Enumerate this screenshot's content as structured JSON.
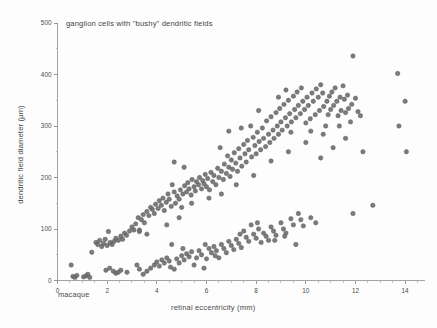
{
  "figure": {
    "width": 437,
    "height": 328,
    "background": "#fdfdfd",
    "corner_note": "macaque"
  },
  "chart_data": {
    "type": "scatter",
    "title": "ganglion cells with \"bushy\" dendritic fields",
    "xlabel": "retinal eccentricity (mm)",
    "ylabel": "dendritic field diameter (µm)",
    "xlim": [
      0,
      14.8
    ],
    "ylim": [
      0,
      500
    ],
    "xticks": [
      0,
      2,
      4,
      6,
      8,
      10,
      12,
      14
    ],
    "yticks": [
      0,
      100,
      200,
      300,
      400,
      500
    ],
    "xticklabels": [
      "0",
      "2",
      "4",
      "6",
      "8",
      "10",
      "12",
      "14"
    ],
    "yticklabels": [
      "0",
      "100",
      "200",
      "300",
      "400",
      "500"
    ],
    "x_minor_step": 0.5,
    "y_minor_step": 50,
    "grid": false,
    "legend": null,
    "annotations": [
      "macaque"
    ],
    "marker": {
      "shape": "circle",
      "color": "#6e6e6e",
      "edge_color": "#5a5a5a",
      "size_px": 4.4,
      "opacity": 0.9
    },
    "series": [
      {
        "name": "upper band (outer/parasol-like bushy cells)",
        "color": "#6e6e6e",
        "points": [
          [
            0.55,
            30
          ],
          [
            0.62,
            8
          ],
          [
            0.7,
            6
          ],
          [
            0.78,
            10
          ],
          [
            1.05,
            7
          ],
          [
            1.15,
            9
          ],
          [
            1.22,
            12
          ],
          [
            1.3,
            6
          ],
          [
            1.38,
            55
          ],
          [
            1.55,
            74
          ],
          [
            1.62,
            70
          ],
          [
            1.7,
            78
          ],
          [
            1.78,
            66
          ],
          [
            1.85,
            72
          ],
          [
            1.92,
            80
          ],
          [
            2.0,
            68
          ],
          [
            2.05,
            95
          ],
          [
            2.12,
            74
          ],
          [
            2.2,
            70
          ],
          [
            2.28,
            76
          ],
          [
            2.35,
            82
          ],
          [
            2.45,
            78
          ],
          [
            2.55,
            86
          ],
          [
            2.62,
            80
          ],
          [
            2.7,
            92
          ],
          [
            2.78,
            88
          ],
          [
            2.9,
            96
          ],
          [
            3.0,
            104
          ],
          [
            3.08,
            98
          ],
          [
            3.15,
            110
          ],
          [
            3.25,
            122
          ],
          [
            3.3,
            95
          ],
          [
            3.38,
            118
          ],
          [
            3.45,
            128
          ],
          [
            3.5,
            112
          ],
          [
            3.6,
            134
          ],
          [
            3.68,
            126
          ],
          [
            3.75,
            142
          ],
          [
            3.82,
            138
          ],
          [
            3.9,
            130
          ],
          [
            3.95,
            148
          ],
          [
            4.05,
            140
          ],
          [
            4.1,
            155
          ],
          [
            4.18,
            146
          ],
          [
            4.25,
            160
          ],
          [
            4.3,
            136
          ],
          [
            4.38,
            152
          ],
          [
            4.45,
            168
          ],
          [
            4.5,
            158
          ],
          [
            4.58,
            144
          ],
          [
            4.62,
            186
          ],
          [
            4.7,
            172
          ],
          [
            4.75,
            150
          ],
          [
            4.82,
            164
          ],
          [
            4.9,
            158
          ],
          [
            4.95,
            176
          ],
          [
            5.0,
            142
          ],
          [
            5.05,
            168
          ],
          [
            5.12,
            184
          ],
          [
            5.2,
            172
          ],
          [
            5.25,
            190
          ],
          [
            5.3,
            178
          ],
          [
            5.38,
            166
          ],
          [
            5.42,
            196
          ],
          [
            5.5,
            182
          ],
          [
            5.55,
            174
          ],
          [
            5.6,
            192
          ],
          [
            5.68,
            186
          ],
          [
            5.72,
            200
          ],
          [
            5.8,
            178
          ],
          [
            5.85,
            194
          ],
          [
            5.9,
            188
          ],
          [
            5.95,
            206
          ],
          [
            6.0,
            182
          ],
          [
            6.05,
            198
          ],
          [
            6.12,
            176
          ],
          [
            6.18,
            210
          ],
          [
            6.25,
            192
          ],
          [
            6.3,
            204
          ],
          [
            6.38,
            186
          ],
          [
            6.45,
            218
          ],
          [
            6.5,
            200
          ],
          [
            6.55,
            258
          ],
          [
            6.6,
            212
          ],
          [
            6.68,
            196
          ],
          [
            6.72,
            226
          ],
          [
            6.8,
            208
          ],
          [
            6.85,
            242
          ],
          [
            6.9,
            220
          ],
          [
            6.95,
            202
          ],
          [
            7.0,
            234
          ],
          [
            7.05,
            216
          ],
          [
            7.12,
            248
          ],
          [
            7.18,
            228
          ],
          [
            7.25,
            212
          ],
          [
            7.3,
            256
          ],
          [
            7.35,
            238
          ],
          [
            7.42,
            222
          ],
          [
            7.5,
            264
          ],
          [
            7.55,
            246
          ],
          [
            7.6,
            230
          ],
          [
            7.65,
            272
          ],
          [
            7.7,
            254
          ],
          [
            7.78,
            300
          ],
          [
            7.82,
            240
          ],
          [
            7.88,
            278
          ],
          [
            7.95,
            262
          ],
          [
            8.0,
            246
          ],
          [
            8.05,
            288
          ],
          [
            8.12,
            270
          ],
          [
            8.18,
            254
          ],
          [
            8.25,
            296
          ],
          [
            8.3,
            276
          ],
          [
            8.38,
            260
          ],
          [
            8.42,
            310
          ],
          [
            8.5,
            284
          ],
          [
            8.55,
            268
          ],
          [
            8.6,
            318
          ],
          [
            8.68,
            292
          ],
          [
            8.72,
            276
          ],
          [
            8.8,
            326
          ],
          [
            8.85,
            300
          ],
          [
            8.9,
            284
          ],
          [
            8.95,
            334
          ],
          [
            9.0,
            308
          ],
          [
            9.05,
            292
          ],
          [
            9.12,
            342
          ],
          [
            9.18,
            316
          ],
          [
            9.2,
            370
          ],
          [
            9.25,
            300
          ],
          [
            9.3,
            350
          ],
          [
            9.35,
            324
          ],
          [
            9.42,
            308
          ],
          [
            9.5,
            358
          ],
          [
            9.55,
            332
          ],
          [
            9.6,
            316
          ],
          [
            9.65,
            366
          ],
          [
            9.7,
            340
          ],
          [
            9.78,
            324
          ],
          [
            9.82,
            374
          ],
          [
            9.88,
            348
          ],
          [
            9.95,
            332
          ],
          [
            10.0,
            306
          ],
          [
            10.05,
            356
          ],
          [
            10.1,
            340
          ],
          [
            10.18,
            314
          ],
          [
            10.25,
            364
          ],
          [
            10.3,
            348
          ],
          [
            10.38,
            322
          ],
          [
            10.42,
            372
          ],
          [
            10.5,
            356
          ],
          [
            10.55,
            330
          ],
          [
            10.6,
            380
          ],
          [
            10.68,
            364
          ],
          [
            10.72,
            338
          ],
          [
            10.8,
            300
          ],
          [
            10.85,
            348
          ],
          [
            10.9,
            322
          ],
          [
            10.95,
            358
          ],
          [
            11.0,
            332
          ],
          [
            11.05,
            366
          ],
          [
            11.12,
            340
          ],
          [
            11.18,
            374
          ],
          [
            11.25,
            348
          ],
          [
            11.3,
            320
          ],
          [
            11.38,
            356
          ],
          [
            11.42,
            330
          ],
          [
            11.5,
            378
          ],
          [
            11.55,
            352
          ],
          [
            11.6,
            326
          ],
          [
            11.68,
            360
          ],
          [
            11.72,
            334
          ],
          [
            11.8,
            308
          ],
          [
            11.85,
            342
          ],
          [
            11.9,
            436
          ],
          [
            12.0,
            354
          ],
          [
            12.1,
            328
          ],
          [
            12.2,
            320
          ],
          [
            12.3,
            250
          ],
          [
            13.7,
            402
          ],
          [
            13.75,
            300
          ],
          [
            14.0,
            348
          ],
          [
            14.05,
            250
          ],
          [
            4.7,
            230
          ],
          [
            5.1,
            220
          ],
          [
            6.9,
            290
          ],
          [
            7.4,
            296
          ],
          [
            8.1,
            330
          ],
          [
            8.9,
            356
          ],
          [
            9.4,
            288
          ],
          [
            10.2,
            290
          ],
          [
            10.7,
            284
          ],
          [
            11.35,
            300
          ],
          [
            3.3,
            98
          ],
          [
            3.6,
            90
          ],
          [
            4.4,
            108
          ],
          [
            4.9,
            122
          ],
          [
            5.4,
            150
          ],
          [
            6.1,
            160
          ],
          [
            6.6,
            168
          ],
          [
            7.2,
            186
          ],
          [
            7.9,
            204
          ],
          [
            8.6,
            232
          ],
          [
            9.3,
            250
          ],
          [
            10.0,
            268
          ],
          [
            10.6,
            238
          ],
          [
            11.1,
            258
          ],
          [
            11.6,
            276
          ]
        ]
      },
      {
        "name": "lower band (inner bushy cells)",
        "color": "#6e6e6e",
        "points": [
          [
            1.95,
            20
          ],
          [
            2.25,
            18
          ],
          [
            2.35,
            14
          ],
          [
            2.45,
            16
          ],
          [
            2.55,
            20
          ],
          [
            3.2,
            30
          ],
          [
            3.3,
            22
          ],
          [
            3.45,
            12
          ],
          [
            3.6,
            18
          ],
          [
            3.75,
            24
          ],
          [
            3.9,
            30
          ],
          [
            4.0,
            36
          ],
          [
            4.1,
            28
          ],
          [
            4.2,
            40
          ],
          [
            4.3,
            34
          ],
          [
            4.4,
            44
          ],
          [
            4.5,
            38
          ],
          [
            4.6,
            70
          ],
          [
            4.7,
            22
          ],
          [
            4.8,
            42
          ],
          [
            4.9,
            34
          ],
          [
            5.0,
            48
          ],
          [
            5.1,
            40
          ],
          [
            5.2,
            52
          ],
          [
            5.3,
            46
          ],
          [
            5.4,
            56
          ],
          [
            5.5,
            30
          ],
          [
            5.6,
            44
          ],
          [
            5.7,
            58
          ],
          [
            5.8,
            50
          ],
          [
            5.9,
            24
          ],
          [
            6.0,
            42
          ],
          [
            6.1,
            62
          ],
          [
            6.2,
            54
          ],
          [
            6.3,
            66
          ],
          [
            6.4,
            58
          ],
          [
            6.5,
            44
          ],
          [
            6.6,
            70
          ],
          [
            6.7,
            62
          ],
          [
            6.8,
            54
          ],
          [
            6.9,
            76
          ],
          [
            7.0,
            68
          ],
          [
            7.1,
            60
          ],
          [
            7.2,
            80
          ],
          [
            7.3,
            72
          ],
          [
            7.4,
            64
          ],
          [
            7.5,
            96
          ],
          [
            7.6,
            84
          ],
          [
            7.7,
            76
          ],
          [
            7.8,
            108
          ],
          [
            7.9,
            90
          ],
          [
            8.0,
            82
          ],
          [
            8.1,
            100
          ],
          [
            8.2,
            74
          ],
          [
            8.3,
            92
          ],
          [
            8.4,
            86
          ],
          [
            8.5,
            78
          ],
          [
            8.6,
            104
          ],
          [
            8.7,
            96
          ],
          [
            8.8,
            88
          ],
          [
            9.0,
            112
          ],
          [
            9.1,
            100
          ],
          [
            9.2,
            92
          ],
          [
            9.4,
            120
          ],
          [
            9.5,
            108
          ],
          [
            9.6,
            70
          ],
          [
            9.7,
            130
          ],
          [
            9.8,
            118
          ],
          [
            9.9,
            106
          ],
          [
            10.2,
            122
          ],
          [
            10.4,
            112
          ],
          [
            11.9,
            130
          ],
          [
            12.7,
            146
          ],
          [
            2.1,
            24
          ],
          [
            2.8,
            16
          ],
          [
            4.55,
            26
          ],
          [
            5.05,
            62
          ],
          [
            5.95,
            70
          ],
          [
            6.35,
            48
          ],
          [
            7.35,
            90
          ],
          [
            8.05,
            112
          ],
          [
            8.75,
            78
          ],
          [
            9.15,
            86
          ]
        ]
      }
    ]
  },
  "axes": {
    "y_axis_name": "y-axis",
    "x_axis_name": "x-axis"
  }
}
